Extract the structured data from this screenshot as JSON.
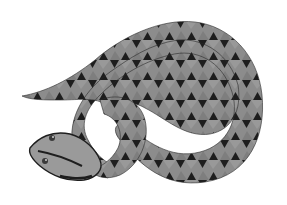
{
  "image": {
    "subject": "Stylized illustration of a coiled snake with grey geometric scale pattern on white background",
    "colors": {
      "background": "#ffffff",
      "body": "#8a8a8a",
      "body_light": "#a6a6a6",
      "stripe": "#9c9c9c",
      "triangles": "#1e1e1e",
      "outline": "#2a2a2a",
      "eye": "#3a3a3a"
    }
  }
}
